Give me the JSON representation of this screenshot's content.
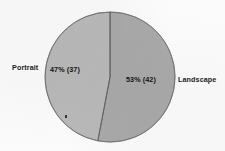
{
  "chart_data": {
    "type": "pie",
    "title": "",
    "subtitle": "",
    "xlabel": "",
    "ylabel": "",
    "legend_position": "outside-labels",
    "grid": false,
    "total_count": 79,
    "categories": [
      "Portrait",
      "Landscape"
    ],
    "values": [
      47,
      53
    ],
    "counts": [
      37,
      42
    ],
    "slices": [
      {
        "label": "Portrait",
        "percent": 47,
        "count": 37,
        "value_label": "47%  (37)",
        "color": "#b9b9b9",
        "side": "left"
      },
      {
        "label": "Landscape",
        "percent": 53,
        "count": 42,
        "value_label": "53%  (42)",
        "color": "#a9a9a9",
        "side": "right"
      }
    ],
    "annotations": []
  },
  "labels": {
    "portrait_label": "Portrait",
    "landscape_label": "Landscape",
    "portrait_value": "47%  (37)",
    "landscape_value": "53%  (42)"
  },
  "colors": {
    "background": "#fbfbfb",
    "portrait_slice": "#b9b9b9",
    "landscape_slice": "#a9a9a9",
    "slice_outline": "#6f6f6f",
    "divider": "#666666",
    "text": "#1b1b1b"
  },
  "geometry": {
    "center_x": 110,
    "center_y": 77,
    "radius": 65,
    "start_angle_deg": 0
  }
}
